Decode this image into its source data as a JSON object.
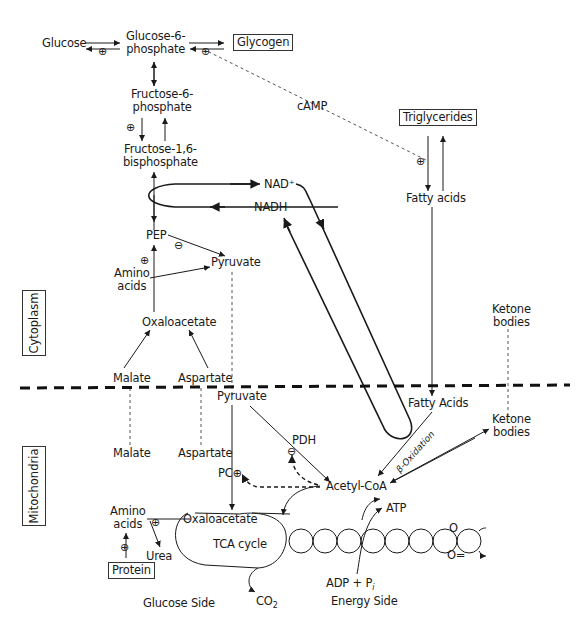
{
  "compartments": {
    "cytoplasm": "Cytoplasm",
    "mitochondria": "Mitochondria"
  },
  "nodes": {
    "glucose": "Glucose",
    "g6p_1": "Glucose-6-",
    "g6p_2": "phosphate",
    "glycogen": "Glycogen",
    "f6p_1": "Fructose-6-",
    "f6p_2": "phosphate",
    "f16bp_1": "Fructose-1,6-",
    "f16bp_2": "bisphosphate",
    "camp": "cAMP",
    "triglycerides": "Triglycerides",
    "fatty_acids_cyto": "Fatty acids",
    "nad_plus": "NAD⁺",
    "nadh": "NADH",
    "pep": "PEP",
    "pyruvate_cyto": "Pyruvate",
    "amino_acids_cyto_1": "Amino",
    "amino_acids_cyto_2": "acids",
    "oxaloacetate_cyto": "Oxaloacetate",
    "malate_cyto": "Malate",
    "aspartate_cyto": "Aspartate",
    "ketone_bodies_cyto_1": "Ketone",
    "ketone_bodies_cyto_2": "bodies",
    "pyruvate_mito": "Pyruvate",
    "fatty_acids_mito": "Fatty Acids",
    "ketone_bodies_mito_1": "Ketone",
    "ketone_bodies_mito_2": "bodies",
    "pdh": "PDH",
    "malate_mito": "Malate",
    "aspartate_mito": "Aspartate",
    "pc": "PC",
    "acetyl_coa": "Acetyl-CoA",
    "beta_oxidation": "β-Oxidation",
    "amino_acids_mito_1": "Amino",
    "amino_acids_mito_2": "acids",
    "oxaloacetate_mito": "Oxaloacetate",
    "tca_cycle": "TCA cycle",
    "urea": "Urea",
    "protein": "Protein",
    "atp": "ATP",
    "o": "O",
    "o_eq": "O=",
    "adp_pi": "ADP + P",
    "adp_pi_sub": "i",
    "co2": "CO",
    "co2_sub": "2",
    "glucose_side": "Glucose Side",
    "energy_side": "Energy Side"
  },
  "symbols": {
    "activate": "⊕",
    "inhibit": "⊖"
  },
  "colors": {
    "line": "#1a1a1a",
    "dashed": "#555555"
  }
}
